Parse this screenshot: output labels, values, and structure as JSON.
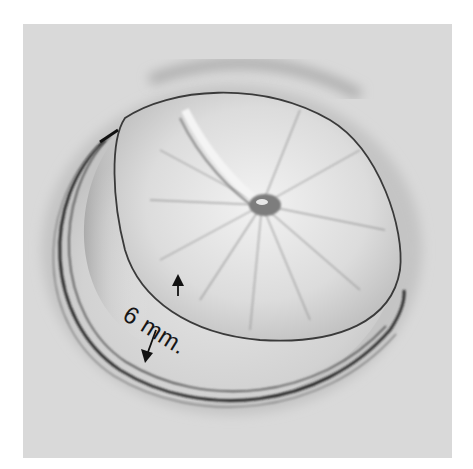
{
  "illustration": {
    "subject": "disc valve seated in ring (pencil drawing)",
    "background_color": "#d9d9d9",
    "page_color": "#ffffff",
    "ink_color": "#1a1a1a",
    "disc_highlight_color": "#efefef"
  },
  "annotation": {
    "label": "6 mm.",
    "arrows": [
      "arrow-up",
      "arrow-down"
    ]
  }
}
